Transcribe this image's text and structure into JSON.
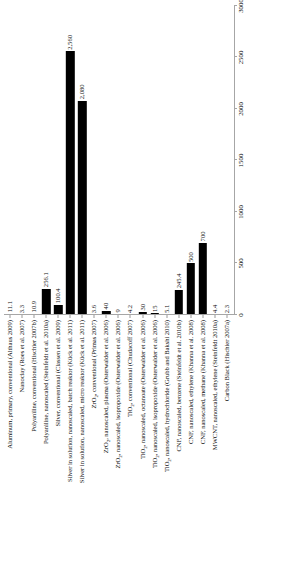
{
  "chart_data": {
    "type": "bar",
    "orientation": "vertical-rotated",
    "title": "",
    "subtitle": "",
    "xlabel": "",
    "ylabel": "",
    "ylim": [
      0,
      3000
    ],
    "grid": false,
    "legend": null,
    "axis_ticks": [
      0,
      500,
      1000,
      1500,
      2000,
      2500,
      3000
    ],
    "axis_tick_labels": [
      "0",
      "500",
      "1000",
      "1500",
      "2000",
      "2500",
      "3000"
    ],
    "bar_color": "#000000",
    "axis_color": "#a6a6a6",
    "categories": [
      "Aluminum, primary, conventional (Althaus 2009)",
      "Nanoclay (Roes et al. 2007)",
      "Polyaniline, conventional (Hischier 2007b)",
      "Polyaniline, nanoscaled (Steinfeldt et al. 2010a)",
      "Silver, conventional (Classen et al. 2009)",
      "Silver in solution, nanoscaled, batch reaktor (Kück et al. 2011)",
      "Silver in solution, nanoscaled, micro reaktor (Kück et al. 2011)",
      "ZrO2, conventional (Primas 2007)",
      "ZrO2, nanoscaled, plasma (Osterwalder et al. 2006)",
      "ZrO2, nanoscaled, isopropoxide (Osterwalder et al. 2006)",
      "TiO2, conventional (Chudacoff 2007)",
      "TiO2, nanoscaled, octanoate (Osterwalder et al. 2006)",
      "TiO2, nanoscaled, isopropoxide (Osterwalder et al. 2006)",
      "TiO2, nanoscaled, hydrochloride (Grubb and Bakshi 2010)",
      "CNF, nanoscaled, benzene (Steinfeldt et al. 2010b)",
      "CNF, nanoscaled, ethylene (Khanna et al. 2008)",
      "CNF, nanoscaled, methane (Khanna et al. 2008)",
      "MWCNT, nanoscaled, ethylene (Steinfeldt 2010a)",
      "Carbon Black (Hischier 2007a)"
    ],
    "values": [
      11.1,
      3.3,
      10.9,
      256.1,
      100.4,
      2560,
      2080,
      3.6,
      40,
      9,
      4.2,
      30,
      15,
      5.1,
      245.4,
      500,
      700,
      4.4,
      2.3
    ],
    "value_labels": [
      "11.1",
      "3.3",
      "10.9",
      "256.1",
      "100.4",
      "2,560",
      "2,080",
      "3.6",
      "40",
      "9",
      "4.2",
      "30",
      "15",
      "5.1",
      "245.4",
      "500",
      "700",
      "4.4",
      "2.3"
    ]
  }
}
